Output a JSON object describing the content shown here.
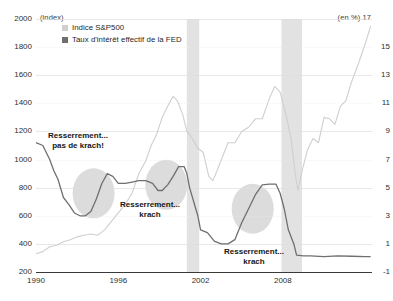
{
  "chart_data": {
    "type": "line",
    "title": "",
    "subtitle": "",
    "left_axis_unit": "(index)",
    "right_axis_unit": "(en %)",
    "xlabel": "",
    "ylabel_left": "index",
    "ylabel_right": "en %",
    "grid": true,
    "legend_position": "top-left",
    "xlim": [
      1990,
      2014.5
    ],
    "ylim_left": [
      200,
      2000
    ],
    "ylim_right": [
      -1,
      17
    ],
    "xticks": [
      "1990",
      "1996",
      "2002",
      "2008"
    ],
    "xtick_values": [
      1990,
      1996,
      2002,
      2008
    ],
    "yticks_left": [
      "2000",
      "1800",
      "1600",
      "1400",
      "1200",
      "1000",
      "800",
      "600",
      "400",
      "200"
    ],
    "ytick_values_left": [
      2000,
      1800,
      1600,
      1400,
      1200,
      1000,
      800,
      600,
      400,
      200
    ],
    "yticks_right": [
      "17",
      "15",
      "13",
      "11",
      "9",
      "7",
      "5",
      "3",
      "1",
      "-1"
    ],
    "ytick_values_right": [
      17,
      15,
      13,
      11,
      9,
      7,
      5,
      3,
      1,
      -1
    ],
    "legend": [
      {
        "label": "Indice S&P500",
        "color": "#cfcfcf",
        "axis": "left"
      },
      {
        "label": "Taux d'intérêt effectif de la FED",
        "color": "#6f6f6f",
        "axis": "right"
      }
    ],
    "series": [
      {
        "name": "Indice S&P500",
        "axis": "left",
        "color": "#cfcfcf",
        "x": [
          1990.0,
          1990.5,
          1991.0,
          1991.5,
          1992.0,
          1992.5,
          1993.0,
          1993.5,
          1994.0,
          1994.5,
          1995.0,
          1995.5,
          1996.0,
          1996.5,
          1997.0,
          1997.5,
          1998.0,
          1998.4,
          1998.8,
          1999.2,
          1999.6,
          2000.0,
          2000.3,
          2000.7,
          2001.0,
          2001.4,
          2001.8,
          2002.2,
          2002.6,
          2002.9,
          2003.2,
          2003.6,
          2004.0,
          2004.5,
          2005.0,
          2005.5,
          2006.0,
          2006.5,
          2007.0,
          2007.4,
          2007.8,
          2008.2,
          2008.6,
          2008.9,
          2009.1,
          2009.4,
          2009.8,
          2010.2,
          2010.6,
          2011.0,
          2011.4,
          2011.8,
          2012.2,
          2012.6,
          2013.0,
          2013.5,
          2014.0,
          2014.4
        ],
        "y": [
          330,
          345,
          380,
          390,
          415,
          430,
          450,
          462,
          470,
          462,
          500,
          560,
          620,
          680,
          760,
          900,
          990,
          1100,
          1180,
          1300,
          1380,
          1450,
          1420,
          1320,
          1200,
          1150,
          1080,
          1050,
          880,
          850,
          920,
          1020,
          1120,
          1120,
          1200,
          1230,
          1290,
          1290,
          1430,
          1520,
          1480,
          1330,
          1150,
          900,
          780,
          920,
          1070,
          1150,
          1120,
          1300,
          1290,
          1250,
          1380,
          1420,
          1550,
          1680,
          1820,
          1950
        ]
      },
      {
        "name": "Taux d'intérêt effectif de la FED",
        "axis": "right",
        "color": "#6f6f6f",
        "x": [
          1990.0,
          1990.5,
          1991.0,
          1991.3,
          1991.6,
          1992.0,
          1992.4,
          1992.8,
          1993.2,
          1993.6,
          1994.0,
          1994.4,
          1994.8,
          1995.2,
          1995.6,
          1996.0,
          1996.5,
          1997.0,
          1997.5,
          1998.0,
          1998.5,
          1998.9,
          1999.2,
          1999.6,
          2000.0,
          2000.4,
          2000.8,
          2001.0,
          2001.2,
          2001.5,
          2001.8,
          2002.0,
          2002.5,
          2003.0,
          2003.5,
          2004.0,
          2004.5,
          2005.0,
          2005.5,
          2006.0,
          2006.5,
          2007.0,
          2007.5,
          2007.8,
          2008.1,
          2008.4,
          2008.8,
          2009.0,
          2009.5,
          2010.0,
          2011.0,
          2012.0,
          2013.0,
          2014.0,
          2014.4
        ],
        "y": [
          8.2,
          8.0,
          7.0,
          6.2,
          5.6,
          4.3,
          3.8,
          3.2,
          3.0,
          3.0,
          3.3,
          4.2,
          5.3,
          6.0,
          5.8,
          5.3,
          5.3,
          5.4,
          5.5,
          5.5,
          5.3,
          4.8,
          4.8,
          5.2,
          5.8,
          6.5,
          6.5,
          6.0,
          5.0,
          4.0,
          3.0,
          2.0,
          1.8,
          1.2,
          1.0,
          1.0,
          1.3,
          2.5,
          3.5,
          4.5,
          5.2,
          5.25,
          5.25,
          4.6,
          3.5,
          2.0,
          1.0,
          0.2,
          0.15,
          0.15,
          0.1,
          0.15,
          0.12,
          0.1,
          0.1
        ]
      }
    ],
    "recession_bands": [
      {
        "start": 2001.0,
        "end": 2001.9,
        "color": "#e2e2e2"
      },
      {
        "start": 2007.9,
        "end": 2009.4,
        "color": "#e2e2e2"
      }
    ],
    "highlight_ellipses": [
      {
        "cx": 1994.2,
        "cy_right": 4.6,
        "color": "#dcdcdc"
      },
      {
        "cx": 1999.5,
        "cy_right": 5.2,
        "color": "#dcdcdc"
      },
      {
        "cx": 2005.8,
        "cy_right": 3.5,
        "color": "#dcdcdc"
      }
    ],
    "annotations": [
      {
        "id": "ann-0",
        "line1": "Resserrement...",
        "line2": "pas de krach!"
      },
      {
        "id": "ann-1",
        "line1": "Resserrement...",
        "line2": "krach"
      },
      {
        "id": "ann-2",
        "line1": "Resserrement...",
        "line2": "krach"
      }
    ]
  }
}
